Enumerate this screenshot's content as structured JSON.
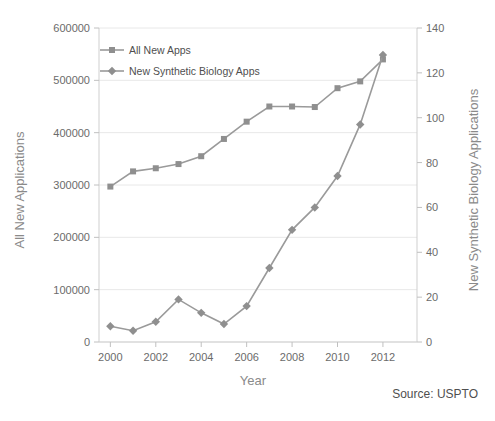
{
  "chart_data": {
    "type": "line",
    "title": "",
    "xlabel": "Year",
    "ylabel": "All New Applications",
    "y2label": "New Synthetic Biology Applications",
    "x": [
      2000,
      2001,
      2002,
      2003,
      2004,
      2005,
      2006,
      2007,
      2008,
      2009,
      2010,
      2011,
      2012,
      2013
    ],
    "xlim": [
      1999.5,
      2013.5
    ],
    "xticks": [
      2000,
      2002,
      2004,
      2006,
      2008,
      2010,
      2012
    ],
    "xticklabels": [
      "2000",
      "2002",
      "2004",
      "2006",
      "2008",
      "2010",
      "2012"
    ],
    "ylim": [
      0,
      600000
    ],
    "yticks": [
      0,
      100000,
      200000,
      300000,
      400000,
      500000,
      600000
    ],
    "yticklabels": [
      "0",
      "100000",
      "200000",
      "300000",
      "400000",
      "500000",
      "600000"
    ],
    "y2lim": [
      0,
      140
    ],
    "y2ticks": [
      0,
      20,
      40,
      60,
      80,
      100,
      120,
      140
    ],
    "y2ticklabels": [
      "0",
      "20",
      "40",
      "60",
      "80",
      "100",
      "120",
      "140"
    ],
    "grid": true,
    "legend_position": "top-left",
    "series": [
      {
        "name": "All New Apps",
        "axis": "left",
        "marker": "square",
        "color": "#8f8f8f",
        "values": [
          297000,
          326000,
          332000,
          340000,
          355000,
          388000,
          421000,
          450000,
          450000,
          449000,
          485000,
          498000,
          540000,
          null
        ]
      },
      {
        "name": "New Synthetic Biology Apps",
        "axis": "right",
        "marker": "diamond",
        "color": "#8f8f8f",
        "values": [
          7,
          5,
          9,
          19,
          13,
          8,
          16,
          33,
          50,
          60,
          74,
          97,
          128,
          null
        ]
      }
    ],
    "annotations": [
      {
        "text": "Source: USPTO",
        "position": "bottom-right"
      }
    ]
  },
  "legend": {
    "items": [
      {
        "label": "All New Apps",
        "marker": "square"
      },
      {
        "label": "New Synthetic Biology Apps",
        "marker": "diamond"
      }
    ]
  },
  "source": {
    "text": "Source: USPTO"
  },
  "colors": {
    "series": "#8f8f8f",
    "line": "#9a9a9a",
    "grid": "#e8e8e8",
    "axis": "#cfcfcf",
    "text": "#595959",
    "axis_title": "#8a8a8a",
    "background": "#ffffff"
  }
}
